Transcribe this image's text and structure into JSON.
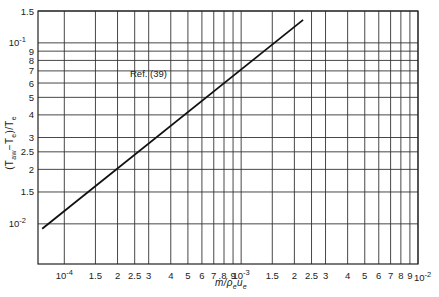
{
  "chart_data": {
    "type": "line",
    "title": "",
    "xlabel": "ṁ/ρeue",
    "ylabel": "(Taw−Te)/Te",
    "xscale": "log",
    "yscale": "log",
    "xlim": [
      7.1e-05,
      0.01
    ],
    "ylim": [
      0.006,
      0.15
    ],
    "grid": true,
    "x_ticks": [
      {
        "value": 0.0001,
        "label": "10",
        "exp": "-4"
      },
      {
        "value": 0.00015,
        "label": "1.5"
      },
      {
        "value": 0.0002,
        "label": "2"
      },
      {
        "value": 0.00025,
        "label": "2.5"
      },
      {
        "value": 0.0003,
        "label": "3"
      },
      {
        "value": 0.0004,
        "label": "4"
      },
      {
        "value": 0.0005,
        "label": "5"
      },
      {
        "value": 0.0006,
        "label": "6"
      },
      {
        "value": 0.0007,
        "label": "7"
      },
      {
        "value": 0.0008,
        "label": "8"
      },
      {
        "value": 0.0009,
        "label": "9"
      },
      {
        "value": 0.001,
        "label": "10",
        "exp": "-3"
      },
      {
        "value": 0.0015,
        "label": "1.5"
      },
      {
        "value": 0.002,
        "label": "2"
      },
      {
        "value": 0.0025,
        "label": "2.5"
      },
      {
        "value": 0.003,
        "label": "3"
      },
      {
        "value": 0.004,
        "label": "4"
      },
      {
        "value": 0.005,
        "label": "5"
      },
      {
        "value": 0.006,
        "label": "6"
      },
      {
        "value": 0.007,
        "label": "7"
      },
      {
        "value": 0.008,
        "label": "8"
      },
      {
        "value": 0.009,
        "label": "9"
      },
      {
        "value": 0.01,
        "label": "10",
        "exp": "-2"
      }
    ],
    "y_ticks": [
      {
        "value": 0.01,
        "label": "10",
        "exp": "-2"
      },
      {
        "value": 0.015,
        "label": "1.5"
      },
      {
        "value": 0.02,
        "label": "2"
      },
      {
        "value": 0.025,
        "label": "2.5"
      },
      {
        "value": 0.03,
        "label": "3"
      },
      {
        "value": 0.04,
        "label": "4"
      },
      {
        "value": 0.05,
        "label": "5"
      },
      {
        "value": 0.06,
        "label": "6"
      },
      {
        "value": 0.07,
        "label": "7"
      },
      {
        "value": 0.08,
        "label": "8"
      },
      {
        "value": 0.09,
        "label": "9"
      },
      {
        "value": 0.1,
        "label": "10",
        "exp": "-1"
      },
      {
        "value": 0.15,
        "label": "1.5"
      }
    ],
    "series": [
      {
        "name": "Ref. (39)",
        "x": [
          7.5e-05,
          0.00224
        ],
        "y": [
          0.0094,
          0.134
        ]
      }
    ],
    "annotations": [
      {
        "text": "Ref. (39)",
        "x": 0.00019,
        "y": 0.07
      }
    ]
  },
  "labels": {
    "annotation": "Ref. (39)"
  }
}
